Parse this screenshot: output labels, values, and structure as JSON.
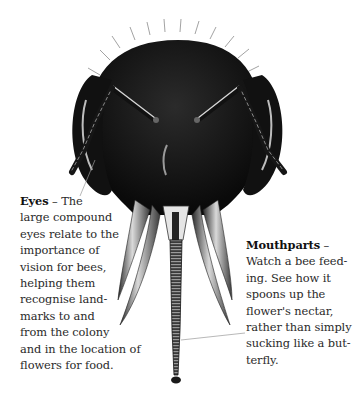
{
  "diagram": {
    "colors": {
      "background": "#ffffff",
      "head": "#151515",
      "text": "#2a2a2a",
      "leader_line": "#9a9a9a"
    }
  },
  "captions": {
    "eyes": {
      "title": "Eyes",
      "dash": " – ",
      "lines": [
        "The",
        "large compound",
        "eyes relate to the",
        "importance of",
        "vision for bees,",
        "helping them",
        "recognise land-",
        "marks to and",
        "from the colony",
        "and in the location of",
        "flowers for food."
      ]
    },
    "mouthparts": {
      "title": "Mouthparts",
      "dash": " –",
      "lines": [
        "Watch a bee feed-",
        "ing. See how it",
        "spoons up the",
        "flower's nectar,",
        "rather than simply",
        "sucking like a but-",
        "terfly."
      ]
    }
  }
}
